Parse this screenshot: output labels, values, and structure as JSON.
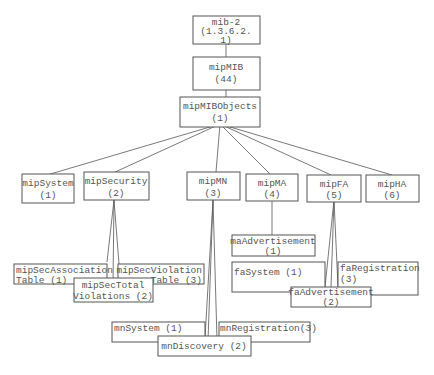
{
  "diagram": {
    "type": "mib-tree",
    "nodes": {
      "mib2": {
        "line1": "mib-2",
        "line2": "(1.3.6.2.",
        "line3": "1)"
      },
      "mipMIB": {
        "line1": "mipMIB",
        "line2": "(44)"
      },
      "mipMIBObjects": {
        "line1": "mipMIBObjects",
        "line2": "(1)"
      },
      "mipSystem": {
        "line1": "mipSystem",
        "line2": "(1)"
      },
      "mipSecurity": {
        "line1": "mipSecurity",
        "line2": "(2)"
      },
      "mipMN": {
        "line1": "mipMN",
        "line2": "(3)"
      },
      "mipMA": {
        "line1": "mipMA",
        "line2": "(4)"
      },
      "mipFA": {
        "line1": "mipFA",
        "line2": "(5)"
      },
      "mipHA": {
        "line1": "mipHA",
        "line2": "(6)"
      },
      "mipSecAssociationTable": {
        "line1": "mipSecAssociation",
        "line2": "Table (1)"
      },
      "mipSecTotalViolations": {
        "line1": "mipSecTotal",
        "line2": "Violations (2)"
      },
      "mipSecViolationTable": {
        "line1": "mipSecViolation",
        "line2": "Table (3)"
      },
      "maAdvertisement": {
        "line1": "maAdvertisement",
        "line2": "(1)"
      },
      "faSystem": {
        "line1": "faSystem (1)"
      },
      "faAdvertisement": {
        "line1": "faAdvertisement",
        "line2": "(2)"
      },
      "faRegistration": {
        "line1": "faRegistration",
        "line2": "(3)"
      },
      "mnSystem": {
        "line1": "mnSystem (1)"
      },
      "mnDiscovery": {
        "line1": "mnDiscovery (2)"
      },
      "mnRegistration": {
        "line1": "mnRegistration(3)"
      }
    },
    "edges": [
      [
        "mib2",
        "mipMIB"
      ],
      [
        "mipMIB",
        "mipMIBObjects"
      ],
      [
        "mipMIBObjects",
        "mipSystem"
      ],
      [
        "mipMIBObjects",
        "mipSecurity"
      ],
      [
        "mipMIBObjects",
        "mipMN"
      ],
      [
        "mipMIBObjects",
        "mipMA"
      ],
      [
        "mipMIBObjects",
        "mipFA"
      ],
      [
        "mipMIBObjects",
        "mipHA"
      ],
      [
        "mipSecurity",
        "mipSecAssociationTable"
      ],
      [
        "mipSecurity",
        "mipSecTotalViolations"
      ],
      [
        "mipSecurity",
        "mipSecViolationTable"
      ],
      [
        "mipMA",
        "maAdvertisement"
      ],
      [
        "mipFA",
        "faSystem"
      ],
      [
        "mipFA",
        "faAdvertisement"
      ],
      [
        "mipFA",
        "faRegistration"
      ],
      [
        "mipMN",
        "mnSystem"
      ],
      [
        "mipMN",
        "mnDiscovery"
      ],
      [
        "mipMN",
        "mnRegistration"
      ]
    ]
  }
}
